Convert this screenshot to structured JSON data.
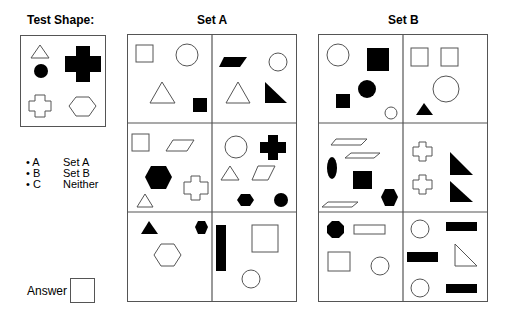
{
  "test_shape": {
    "title": "Test Shape:",
    "shapes": [
      "outline-triangle",
      "filled-circle",
      "filled-large-cross",
      "outline-cross",
      "outline-hexagon"
    ]
  },
  "set_a": {
    "title": "Set A",
    "panels": [
      [
        "outline-square",
        "outline-circle",
        "outline-triangle",
        "filled-square"
      ],
      [
        "filled-parallelogram",
        "outline-circle",
        "outline-triangle",
        "filled-right-triangle"
      ],
      [
        "outline-square",
        "outline-parallelogram",
        "filled-hexagon",
        "outline-cross",
        "outline-triangle"
      ],
      [
        "outline-circle",
        "filled-cross",
        "outline-triangle",
        "outline-parallelogram",
        "filled-hexagon",
        "filled-circle"
      ],
      [
        "filled-triangle",
        "filled-hexagon",
        "outline-hexagon"
      ],
      [
        "filled-bar",
        "outline-square",
        "outline-circle"
      ]
    ]
  },
  "set_b": {
    "title": "Set B",
    "panels": [
      [
        "outline-circle",
        "filled-square",
        "filled-circle",
        "filled-square",
        "outline-circle"
      ],
      [
        "outline-square",
        "outline-square",
        "outline-circle",
        "filled-triangle"
      ],
      [
        "outline-parallelogram",
        "outline-parallelogram",
        "filled-ellipse",
        "filled-square",
        "filled-hexagon",
        "outline-parallelogram"
      ],
      [
        "outline-cross",
        "filled-right-triangle",
        "outline-cross",
        "filled-right-triangle"
      ],
      [
        "filled-octagon",
        "outline-rectangle",
        "outline-square",
        "outline-circle"
      ],
      [
        "outline-circle",
        "filled-bar",
        "filled-bar",
        "outline-right-triangle",
        "outline-circle",
        "filled-bar"
      ]
    ]
  },
  "options": [
    {
      "key": "• A",
      "label": "Set A"
    },
    {
      "key": "• B",
      "label": "Set B"
    },
    {
      "key": "• C",
      "label": "Neither"
    }
  ],
  "answer": {
    "label": "Answer",
    "value": ""
  }
}
